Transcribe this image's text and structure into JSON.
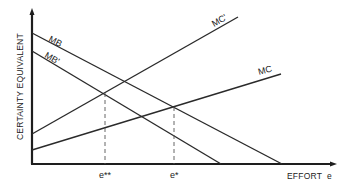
{
  "diagram": {
    "y_axis_label": "CERTAINTY EQUIVALENT",
    "x_axis_label": "EFFORT  e",
    "curves": [
      {
        "name": "MB",
        "label": "MB",
        "type": "marginal-benefit",
        "slope": "downward",
        "from": [
          32,
          33
        ],
        "to": [
          282,
          164
        ]
      },
      {
        "name": "MB'",
        "label": "MB'",
        "type": "marginal-benefit",
        "slope": "downward",
        "from": [
          32,
          51
        ],
        "to": [
          221,
          164
        ]
      },
      {
        "name": "MC'",
        "label": "MC'",
        "type": "marginal-cost",
        "slope": "upward",
        "from": [
          32,
          134
        ],
        "to": [
          238,
          17
        ]
      },
      {
        "name": "MC",
        "label": "MC",
        "type": "marginal-cost",
        "slope": "upward",
        "from": [
          32,
          150
        ],
        "to": [
          281,
          74
        ]
      }
    ],
    "equilibria": [
      {
        "label": "e**",
        "intersection": [
          "MB'",
          "MC'"
        ]
      },
      {
        "label": "e*",
        "intersection": [
          "MB",
          "MC"
        ]
      }
    ],
    "tick_labels": {
      "e_double_star": "e**",
      "e_star": "e*"
    }
  }
}
